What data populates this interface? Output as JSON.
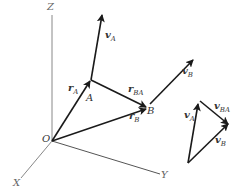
{
  "diagram": {
    "type": "3d-relative-velocity-vectors",
    "axes": {
      "x": "X",
      "y": "Y",
      "z": "Z",
      "origin": "O"
    },
    "points": {
      "a": "A",
      "b": "B"
    },
    "vectors": {
      "r_a": {
        "sym": "r",
        "sub": "A"
      },
      "r_b": {
        "sym": "r",
        "sub": "B"
      },
      "r_ba": {
        "sym": "r",
        "sub": "BA"
      },
      "v_a": {
        "sym": "v",
        "sub": "A"
      },
      "v_b": {
        "sym": "v",
        "sub": "B"
      },
      "triangle_v_a": {
        "sym": "v",
        "sub": "A"
      },
      "triangle_v_b": {
        "sym": "v",
        "sub": "B"
      },
      "triangle_v_ba": {
        "sym": "v",
        "sub": "BA"
      }
    },
    "colors": {
      "vector": "#1a1a1a",
      "axis": "#777777",
      "background": "#ffffff"
    }
  }
}
